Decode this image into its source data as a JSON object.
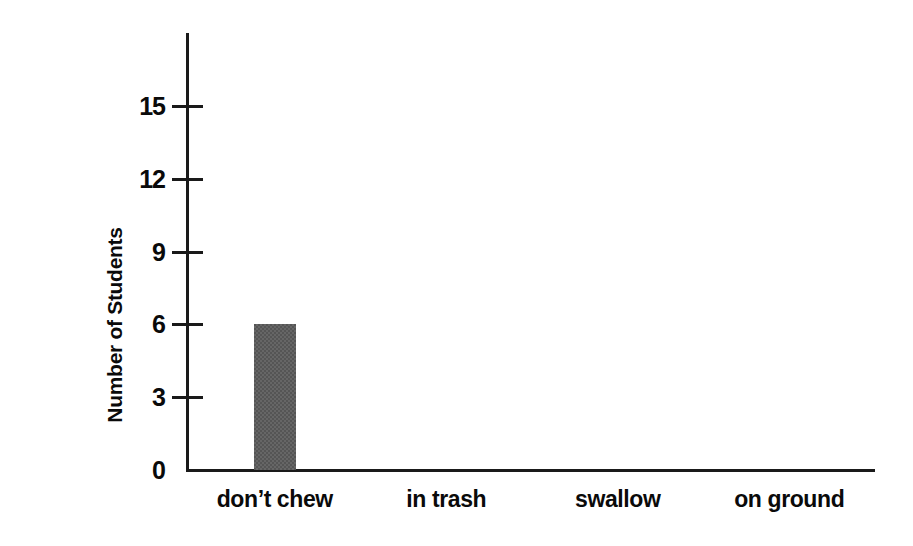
{
  "chart_data": {
    "type": "bar",
    "title": "",
    "subtitle": "",
    "xlabel": "",
    "ylabel": "Number of Students",
    "categories": [
      "don’t chew",
      "in trash",
      "swallow",
      "on ground"
    ],
    "values": [
      6,
      0,
      0,
      0
    ],
    "ylim": [
      0,
      18
    ],
    "y_ticks": [
      0,
      3,
      6,
      9,
      12,
      15
    ],
    "y_tick_labels": [
      "0",
      "3",
      "6",
      "9",
      "12",
      "15"
    ],
    "grid": false,
    "legend": false,
    "legend_position": "none",
    "bar_color": "#555555",
    "axis_color": "#1a1a1a",
    "background_color": "#ffffff",
    "annotations": []
  },
  "axes": {
    "y_title": "Number of Students",
    "y_tick_labels": [
      "15",
      "12",
      "9",
      "6",
      "3",
      "0"
    ]
  },
  "x_axis": {
    "labels": [
      "don’t chew",
      "in trash",
      "swallow",
      "on ground"
    ]
  }
}
